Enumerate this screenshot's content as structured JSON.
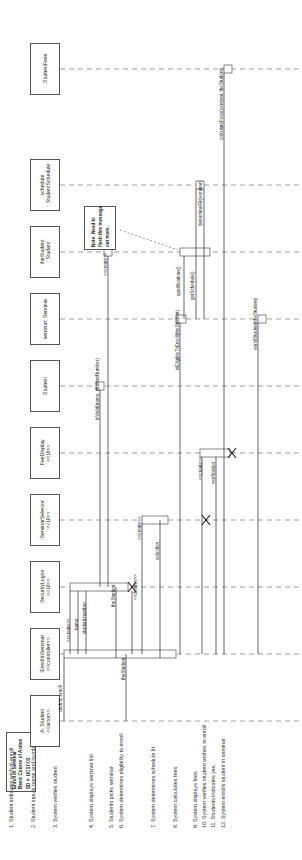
{
  "title_note": {
    "lines": [
      "Enroll in Seminar",
      "Basic Course of Action",
      "SD #: UC17-01"
    ]
  },
  "steps": [
    "1. Student indicates wish to enroll",
    "2. Student inputs name and number",
    "3. System verifies student",
    "4. System displays seminar list",
    "5. Students picks seminar",
    "6. System determines eligibility to enroll",
    "7. System determines schedule fit",
    "8. System calculates fees",
    "9. System displays fees",
    "10. System verifies student wishes to enroll",
    "11. Students indicates yes.",
    "12. System enrolls student in seminar"
  ],
  "lifelines": [
    {
      "name": "A: Student",
      "stereo": "<<actor>>"
    },
    {
      "name": ":EnrollInSeminar",
      "stereo": "<<controller>>"
    },
    {
      "name": ":SecurityLogon",
      "stereo": "<<UI>>"
    },
    {
      "name": ":SeminarSelector",
      "stereo": "<<UI>>"
    },
    {
      "name": ":FeeDisplay",
      "stereo": "<<UI>>"
    },
    {
      "name": "Student",
      "stereo": ""
    },
    {
      "name": "seminar: Seminar",
      "stereo": ""
    },
    {
      "name": "theStudent",
      "stereo": ": Student"
    },
    {
      "name": "schedule",
      "stereo": ": StudentSchedule"
    },
    {
      "name": ":StudentFees",
      "stereo": ""
    }
  ],
  "messages": [
    {
      "label": "wish to enroll"
    },
    {
      "label": "<<create>>"
    },
    {
      "label": "name"
    },
    {
      "label": "student number"
    },
    {
      "label": "isValid(name, studentNumber)"
    },
    {
      "label": "<<create>>"
    },
    {
      "label": "theStudent"
    },
    {
      "label": "theStudent"
    },
    {
      "label": "<<destroy>>"
    },
    {
      "label": "<<create>>"
    },
    {
      "label": "selection"
    },
    {
      "label": "isEligibleToEnroll(theStudent)"
    },
    {
      "label": "qualifications()"
    },
    {
      "label": "getSchedule()"
    },
    {
      "label": "determineFit(seminar)"
    },
    {
      "label": "calculateFees(seminar, theStudent)"
    },
    {
      "label": "<<create>>"
    },
    {
      "label": "verification"
    },
    {
      "label": "enrollStudent(theStudent)"
    }
  ],
  "comment_note": {
    "lines": [
      "Note: Need to",
      "flesh this message",
      "out more."
    ]
  }
}
